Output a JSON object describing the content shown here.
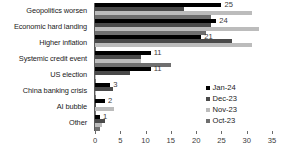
{
  "chart_data": {
    "type": "bar",
    "orientation": "horizontal",
    "title": "",
    "subtitle": "",
    "xlabel": "",
    "ylabel": "",
    "xlim": [
      0,
      35
    ],
    "xticks": [
      0,
      5,
      10,
      15,
      20,
      25,
      30,
      35
    ],
    "xtick_labels": [
      "0",
      "5",
      "10",
      "15",
      "20",
      "25",
      "30",
      "35"
    ],
    "grid": false,
    "legend_position": "right-middle",
    "categories": [
      "Geopolitics worsen",
      "Economic hard landing",
      "Higher inflation",
      "Systemic credit event",
      "US election",
      "China banking crisis",
      "AI bubble",
      "Other"
    ],
    "series": [
      {
        "name": "Jan-24",
        "color": "#000000",
        "values": [
          25,
          24,
          21,
          11,
          11,
          3,
          2,
          1
        ],
        "data_labels": [
          "25",
          "24",
          "21",
          "11",
          "11",
          "3",
          "2",
          "1"
        ]
      },
      {
        "name": "Dec-23",
        "color": "#4a4a4a",
        "values": [
          17.5,
          23,
          27,
          9,
          7,
          3.5,
          0,
          2
        ],
        "data_labels": [
          "",
          "",
          "",
          "",
          "",
          "",
          "",
          ""
        ]
      },
      {
        "name": "Nov-23",
        "color": "#bcbcbc",
        "values": [
          31,
          32.5,
          31,
          9,
          0,
          0,
          3.8,
          1.3
        ],
        "data_labels": [
          "",
          "",
          "",
          "",
          "",
          "",
          "",
          ""
        ]
      },
      {
        "name": "Oct-23",
        "color": "#6f6f6f",
        "values": [
          23,
          22,
          0,
          15,
          0,
          0,
          0,
          1
        ],
        "data_labels": [
          "",
          "",
          "",
          "",
          "",
          "",
          "",
          ""
        ]
      }
    ]
  },
  "legend": {
    "items": [
      {
        "label": "Jan-24",
        "color": "#000000"
      },
      {
        "label": "Dec-23",
        "color": "#4a4a4a"
      },
      {
        "label": "Nov-23",
        "color": "#bcbcbc"
      },
      {
        "label": "Oct-23",
        "color": "#6f6f6f"
      }
    ]
  }
}
